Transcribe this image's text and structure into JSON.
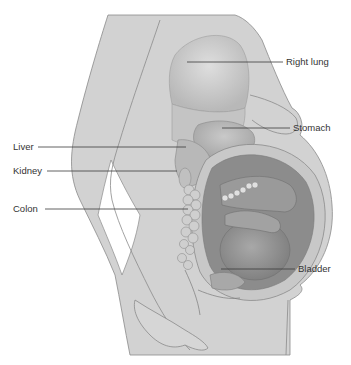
{
  "diagram": {
    "colors": {
      "background": "#ffffff",
      "skin": "#d2d2d2",
      "skin_outline": "#8a8a8a",
      "organ_light": "#bdbdbd",
      "organ_dark": "#9a9a9a",
      "uterus_wall": "#c8c8c8",
      "leader_line": "#3a3a3a",
      "label_text": "#333333"
    },
    "labels": {
      "right_lung": "Right lung",
      "stomach": "Stomach",
      "liver": "Liver",
      "kidney": "Kidney",
      "colon": "Colon",
      "bladder": "Bladder"
    }
  }
}
